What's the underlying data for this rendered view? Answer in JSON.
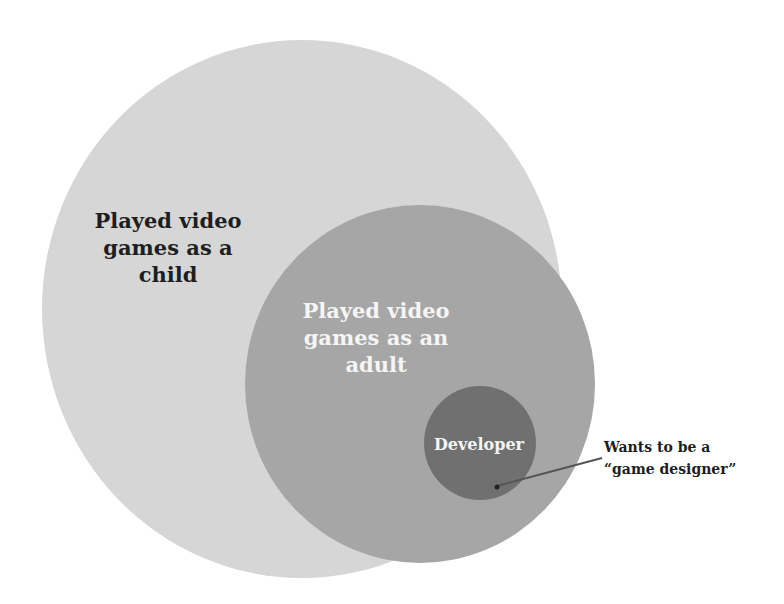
{
  "diagram": {
    "type": "nested-venn",
    "colors": {
      "background": "#ffffff",
      "outer": "#d6d6d6",
      "middle": "#a6a6a6",
      "inner": "#707070",
      "text_dark": "#1e1e1e",
      "text_light": "#f5f5f5",
      "leader_line": "#555555"
    },
    "sets": [
      {
        "id": "child",
        "label_lines": [
          "Played video",
          "games as a",
          "child"
        ]
      },
      {
        "id": "adult",
        "label_lines": [
          "Played video",
          "games as an",
          "adult"
        ]
      },
      {
        "id": "developer",
        "label_lines": [
          "Developer"
        ]
      }
    ],
    "annotation": {
      "label_lines": [
        "Wants to be a",
        "“game designer”"
      ]
    }
  }
}
